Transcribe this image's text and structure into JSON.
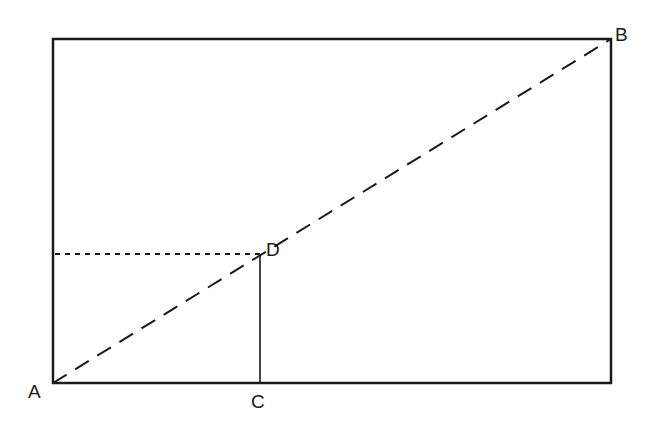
{
  "diagram": {
    "type": "geometry",
    "colors": {
      "stroke": "#1a1a1a",
      "background": "#ffffff"
    },
    "rectangle": {
      "x1": 53,
      "y1": 39,
      "x2": 611,
      "y2": 383
    },
    "points": {
      "A": {
        "label": "A",
        "x": 53,
        "y": 383
      },
      "B": {
        "label": "B",
        "x": 611,
        "y": 39
      },
      "C": {
        "label": "C",
        "x": 260,
        "y": 383
      },
      "D": {
        "label": "D",
        "x": 260,
        "y": 254
      }
    },
    "segments": [
      {
        "name": "diagonal-AB",
        "from": "A",
        "to": "B",
        "style": "dashed"
      },
      {
        "name": "horizontal-to-D",
        "from": "left-edge",
        "to": "D",
        "style": "dotted"
      },
      {
        "name": "vertical-DC",
        "from": "D",
        "to": "C",
        "style": "solid"
      }
    ]
  }
}
